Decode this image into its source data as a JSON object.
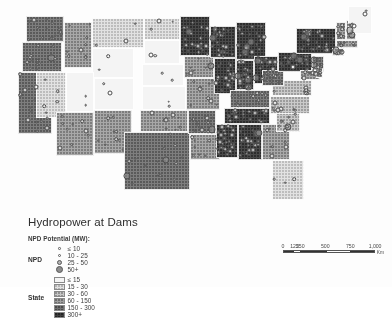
{
  "map": {
    "title": "Hydropower at Dams",
    "region": "Contiguous United States"
  },
  "legend": {
    "heading": "NPD Potential (MW):",
    "point_row_label": "NPD",
    "point_classes": [
      {
        "label": "≤ 10",
        "symbol": "small-circle"
      },
      {
        "label": "10 - 25",
        "symbol": "medium-circle"
      },
      {
        "label": "25 - 50",
        "symbol": "large-circle"
      },
      {
        "label": "50+",
        "symbol": "xlarge-circle"
      }
    ],
    "state_row_label": "State",
    "state_classes": [
      {
        "label": "≤ 15",
        "swatch": "lightest-halftone"
      },
      {
        "label": "15 - 30",
        "swatch": "light-halftone"
      },
      {
        "label": "30 - 60",
        "swatch": "medium-light-halftone"
      },
      {
        "label": "60 - 150",
        "swatch": "medium-dark-halftone"
      },
      {
        "label": "150 - 300",
        "swatch": "dark-halftone"
      },
      {
        "label": "300+",
        "swatch": "darkest-halftone"
      }
    ]
  },
  "scalebar": {
    "ticks": [
      "0",
      "125",
      "250",
      "500",
      "750",
      "1,000"
    ],
    "unit": "Km"
  },
  "chart_data": {
    "type": "map",
    "title": "Hydropower at Dams",
    "variable": "NPD Potential (MW)",
    "state_class_breaks": [
      15,
      30,
      60,
      150,
      300
    ],
    "state_class_labels": [
      "≤ 15",
      "15 - 30",
      "30 - 60",
      "60 - 150",
      "150 - 300",
      "300+"
    ],
    "point_class_breaks": [
      10,
      25,
      50
    ],
    "point_class_labels": [
      "≤ 10",
      "10 - 25",
      "25 - 50",
      "50+"
    ],
    "states": [
      {
        "code": "WA",
        "fill": 5,
        "x": 26,
        "y": 16,
        "w": 38,
        "h": 26
      },
      {
        "code": "OR",
        "fill": 5,
        "x": 22,
        "y": 42,
        "w": 40,
        "h": 30
      },
      {
        "code": "CA",
        "fill": 5,
        "x": 18,
        "y": 72,
        "w": 34,
        "h": 62
      },
      {
        "code": "ID",
        "fill": 4,
        "x": 64,
        "y": 22,
        "w": 28,
        "h": 46
      },
      {
        "code": "NV",
        "fill": 2,
        "x": 36,
        "y": 72,
        "w": 30,
        "h": 46
      },
      {
        "code": "MT",
        "fill": 2,
        "x": 92,
        "y": 18,
        "w": 52,
        "h": 30
      },
      {
        "code": "WY",
        "fill": 1,
        "x": 92,
        "y": 48,
        "w": 42,
        "h": 30
      },
      {
        "code": "UT",
        "fill": 1,
        "x": 66,
        "y": 72,
        "w": 28,
        "h": 40
      },
      {
        "code": "CO",
        "fill": 1,
        "x": 94,
        "y": 78,
        "w": 40,
        "h": 32
      },
      {
        "code": "AZ",
        "fill": 4,
        "x": 56,
        "y": 112,
        "w": 38,
        "h": 44
      },
      {
        "code": "NM",
        "fill": 4,
        "x": 94,
        "y": 110,
        "w": 38,
        "h": 44
      },
      {
        "code": "ND",
        "fill": 2,
        "x": 144,
        "y": 18,
        "w": 36,
        "h": 22
      },
      {
        "code": "SD",
        "fill": 1,
        "x": 144,
        "y": 40,
        "w": 36,
        "h": 24
      },
      {
        "code": "NE",
        "fill": 1,
        "x": 142,
        "y": 64,
        "w": 42,
        "h": 22
      },
      {
        "code": "KS",
        "fill": 1,
        "x": 142,
        "y": 86,
        "w": 44,
        "h": 24
      },
      {
        "code": "OK",
        "fill": 4,
        "x": 140,
        "y": 110,
        "w": 48,
        "h": 22
      },
      {
        "code": "TX",
        "fill": 5,
        "x": 124,
        "y": 132,
        "w": 66,
        "h": 58
      },
      {
        "code": "MN",
        "fill": 6,
        "x": 180,
        "y": 16,
        "w": 30,
        "h": 40
      },
      {
        "code": "IA",
        "fill": 4,
        "x": 184,
        "y": 56,
        "w": 30,
        "h": 22
      },
      {
        "code": "MO",
        "fill": 4,
        "x": 186,
        "y": 78,
        "w": 34,
        "h": 32
      },
      {
        "code": "AR",
        "fill": 5,
        "x": 188,
        "y": 110,
        "w": 28,
        "h": 24
      },
      {
        "code": "LA",
        "fill": 4,
        "x": 190,
        "y": 134,
        "w": 30,
        "h": 26
      },
      {
        "code": "WI",
        "fill": 6,
        "x": 210,
        "y": 26,
        "w": 26,
        "h": 32
      },
      {
        "code": "IL",
        "fill": 6,
        "x": 214,
        "y": 58,
        "w": 22,
        "h": 36
      },
      {
        "code": "MI",
        "fill": 6,
        "x": 236,
        "y": 22,
        "w": 30,
        "h": 38
      },
      {
        "code": "IN",
        "fill": 6,
        "x": 236,
        "y": 60,
        "w": 18,
        "h": 30
      },
      {
        "code": "OH",
        "fill": 6,
        "x": 254,
        "y": 56,
        "w": 24,
        "h": 28
      },
      {
        "code": "KY",
        "fill": 5,
        "x": 230,
        "y": 90,
        "w": 40,
        "h": 18
      },
      {
        "code": "TN",
        "fill": 6,
        "x": 224,
        "y": 108,
        "w": 46,
        "h": 16
      },
      {
        "code": "MS",
        "fill": 6,
        "x": 216,
        "y": 124,
        "w": 22,
        "h": 34
      },
      {
        "code": "AL",
        "fill": 6,
        "x": 238,
        "y": 124,
        "w": 24,
        "h": 36
      },
      {
        "code": "GA",
        "fill": 4,
        "x": 262,
        "y": 124,
        "w": 28,
        "h": 36
      },
      {
        "code": "FL",
        "fill": 2,
        "x": 272,
        "y": 160,
        "w": 32,
        "h": 40
      },
      {
        "code": "SC",
        "fill": 3,
        "x": 276,
        "y": 112,
        "w": 24,
        "h": 20
      },
      {
        "code": "NC",
        "fill": 3,
        "x": 270,
        "y": 96,
        "w": 40,
        "h": 18
      },
      {
        "code": "VA",
        "fill": 3,
        "x": 272,
        "y": 80,
        "w": 40,
        "h": 16
      },
      {
        "code": "WV",
        "fill": 5,
        "x": 262,
        "y": 70,
        "w": 22,
        "h": 16
      },
      {
        "code": "PA",
        "fill": 6,
        "x": 278,
        "y": 52,
        "w": 34,
        "h": 20
      },
      {
        "code": "NY",
        "fill": 6,
        "x": 296,
        "y": 28,
        "w": 40,
        "h": 26
      },
      {
        "code": "VT",
        "fill": 4,
        "x": 336,
        "y": 22,
        "w": 10,
        "h": 18
      },
      {
        "code": "NH",
        "fill": 4,
        "x": 346,
        "y": 20,
        "w": 10,
        "h": 20
      },
      {
        "code": "ME",
        "fill": 1,
        "x": 348,
        "y": 6,
        "w": 24,
        "h": 28
      },
      {
        "code": "MA",
        "fill": 4,
        "x": 336,
        "y": 40,
        "w": 22,
        "h": 8
      },
      {
        "code": "CT",
        "fill": 4,
        "x": 332,
        "y": 48,
        "w": 12,
        "h": 8
      },
      {
        "code": "NJ",
        "fill": 5,
        "x": 312,
        "y": 56,
        "w": 12,
        "h": 16
      },
      {
        "code": "MD",
        "fill": 4,
        "x": 300,
        "y": 70,
        "w": 20,
        "h": 10
      },
      {
        "code": "DE",
        "fill": 3,
        "x": 316,
        "y": 68,
        "w": 7,
        "h": 10
      }
    ],
    "dam_count_visible": 360
  }
}
